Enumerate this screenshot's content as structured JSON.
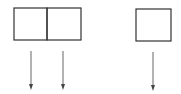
{
  "diagram": {
    "stroke_color": "#333333",
    "arrow_color": "#555555",
    "boxes": [
      {
        "id": "box-left-a",
        "x": 14,
        "y": 8,
        "w": 33,
        "h": 32
      },
      {
        "id": "box-left-b",
        "x": 47,
        "y": 8,
        "w": 34,
        "h": 32
      },
      {
        "id": "box-right",
        "x": 136,
        "y": 9,
        "w": 35,
        "h": 32
      }
    ],
    "arrows": [
      {
        "id": "arrow-1",
        "x": 31,
        "y1": 51,
        "y2": 89
      },
      {
        "id": "arrow-2",
        "x": 63,
        "y1": 51,
        "y2": 89
      },
      {
        "id": "arrow-3",
        "x": 153,
        "y1": 52,
        "y2": 90
      }
    ]
  }
}
